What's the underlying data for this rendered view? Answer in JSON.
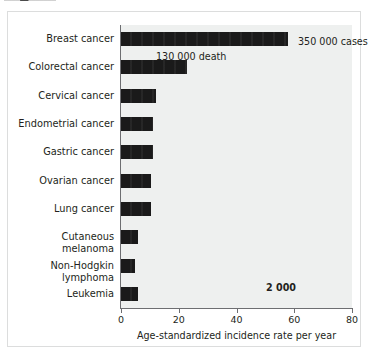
{
  "figure": {
    "caption_fragment": ""
  },
  "chart_data": {
    "type": "bar",
    "orientation": "horizontal",
    "title": "",
    "xlabel": "Age-standardized incidence rate per year",
    "ylabel": "",
    "xlim": [
      0,
      80
    ],
    "xticks": [
      0,
      20,
      40,
      60,
      80
    ],
    "xtick_labels": [
      "0",
      "20",
      "40",
      "60",
      "80"
    ],
    "grid": false,
    "legend": null,
    "bar_color": "#1a1a1a",
    "plot_background": "#eef0ef",
    "categories": [
      "Breast cancer",
      "Colorectal cancer",
      "Cervical cancer",
      "Endometrial cancer",
      "Gastric cancer",
      "Ovarian cancer",
      "Lung cancer",
      "Cutaneous melanoma",
      "Non-Hodgkin lymphoma",
      "Leukemia"
    ],
    "values": [
      58,
      23,
      12,
      11,
      11,
      10.5,
      10.5,
      6,
      5,
      6
    ],
    "annotations": [
      {
        "id": "cases",
        "text": "350 000 cases",
        "bold": false
      },
      {
        "id": "death",
        "text": "130 000 death",
        "bold": false
      },
      {
        "id": "small",
        "text": "2 000",
        "bold": true
      }
    ]
  }
}
